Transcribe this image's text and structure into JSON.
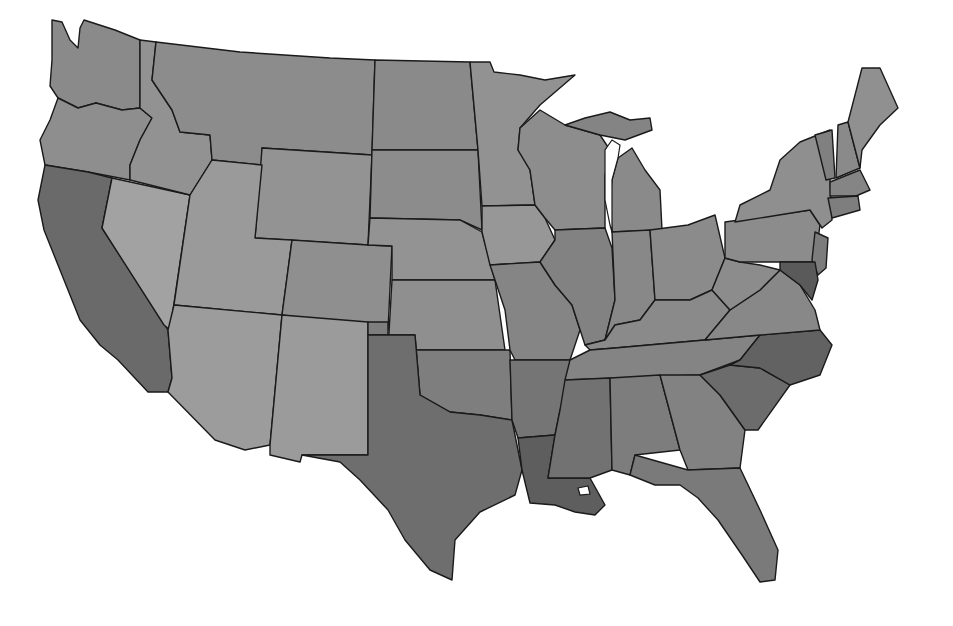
{
  "map": {
    "type": "choropleth",
    "region": "Contiguous United States",
    "granularity": "county",
    "color_scheme": "grayscale",
    "background": "#ffffff",
    "border_color": "#1a1a1a",
    "legend": null,
    "title": null,
    "states": [
      {
        "id": "WA",
        "fill": "#8a8a8a",
        "points": "52,20 62,22 70,40 78,48 80,28 84,20 115,30 140,40 140,108 122,110 96,103 78,108 58,98 50,86 52,60"
      },
      {
        "id": "OR",
        "fill": "#8e8e8e",
        "points": "58,98 78,108 96,103 122,110 140,108 152,118 140,140 130,165 130,180 88,172 45,165 40,140 50,120"
      },
      {
        "id": "CA",
        "fill": "#6a6a6a",
        "points": "45,165 88,172 112,178 102,228 168,330 172,378 168,392 148,392 118,360 100,345 80,320 60,270 44,230 38,200"
      },
      {
        "id": "NV",
        "fill": "#a2a2a2",
        "points": "112,178 190,195 170,330 164,325 102,228"
      },
      {
        "id": "ID",
        "fill": "#929292",
        "points": "140,40 156,42 152,80 172,110 180,132 210,135 212,160 190,195 130,180 130,165 140,140 152,118 140,108"
      },
      {
        "id": "MT",
        "fill": "#8c8c8c",
        "points": "156,42 240,52 330,58 375,60 372,155 262,148 262,165 212,160 210,135 180,132 172,110 152,80"
      },
      {
        "id": "WY",
        "fill": "#939393",
        "points": "262,148 372,155 368,245 255,238"
      },
      {
        "id": "UT",
        "fill": "#9a9a9a",
        "points": "190,195 212,160 262,165 255,238 292,240 282,315 174,305"
      },
      {
        "id": "AZ",
        "fill": "#9c9c9c",
        "points": "174,305 282,315 270,445 245,450 215,440 168,392 172,378 168,330"
      },
      {
        "id": "CO",
        "fill": "#8f8f8f",
        "points": "292,240 368,245 392,246 388,330 282,315"
      },
      {
        "id": "NM",
        "fill": "#9b9b9b",
        "points": "282,315 368,322 368,455 302,455 300,462 270,455 270,445"
      },
      {
        "id": "ND",
        "fill": "#8a8a8a",
        "points": "375,60 470,62 478,150 372,150"
      },
      {
        "id": "SD",
        "fill": "#8c8c8c",
        "points": "372,150 478,150 482,230 460,220 370,218"
      },
      {
        "id": "NE",
        "fill": "#939393",
        "points": "370,218 460,220 482,232 495,280 392,280 392,246 368,245"
      },
      {
        "id": "KS",
        "fill": "#8f8f8f",
        "points": "392,280 495,280 505,350 388,350"
      },
      {
        "id": "OK",
        "fill": "#7e7e7e",
        "points": "368,322 388,322 388,350 510,350 512,420 480,415 450,412 420,395 415,335 368,335"
      },
      {
        "id": "TX",
        "fill": "#6e6e6e",
        "points": "368,335 415,335 420,395 450,412 480,415 512,420 522,470 515,495 480,512 455,540 452,580 430,570 405,540 388,510 360,480 340,462 302,455 368,455"
      },
      {
        "id": "MN",
        "fill": "#929292",
        "points": "470,62 490,62 494,72 520,75 545,80 575,75 540,105 520,128 518,150 530,170 535,205 482,206 478,150"
      },
      {
        "id": "IA",
        "fill": "#979797",
        "points": "482,206 535,205 545,218 555,240 540,262 490,265 482,232"
      },
      {
        "id": "MO",
        "fill": "#858585",
        "points": "490,265 540,262 555,285 572,305 580,330 570,360 515,360 510,350 505,310 495,280"
      },
      {
        "id": "AR",
        "fill": "#757575",
        "points": "510,360 570,360 572,385 560,410 555,435 518,438 512,420"
      },
      {
        "id": "LA",
        "fill": "#5e5e5e",
        "points": "518,438 555,435 548,478 590,478 605,505 595,515 575,512 555,505 530,503 522,470"
      },
      {
        "id": "WI",
        "fill": "#8d8d8d",
        "points": "520,128 540,110 565,125 600,135 610,150 605,175 605,228 555,230 545,218 535,205 530,170 518,150"
      },
      {
        "id": "IL",
        "fill": "#828282",
        "points": "555,230 605,228 612,248 615,300 605,340 585,345 572,305 555,285 540,262 555,240"
      },
      {
        "id": "MI",
        "fill": "#8a8a8a",
        "points": "618,158 632,148 645,170 660,190 662,230 612,232 610,200 612,180"
      },
      {
        "id": "MI-UP",
        "fill": "#848484",
        "points": "565,125 585,118 610,112 630,120 650,118 652,130 625,140 600,135"
      },
      {
        "id": "IN",
        "fill": "#888888",
        "points": "612,232 650,230 655,300 640,320 615,325 605,340 615,300"
      },
      {
        "id": "OH",
        "fill": "#8b8b8b",
        "points": "650,230 688,225 715,215 725,258 712,290 690,300 660,300 655,300"
      },
      {
        "id": "KY",
        "fill": "#8a8a8a",
        "points": "585,345 605,340 615,325 640,320 655,300 690,300 712,290 730,310 705,340 615,348 590,350"
      },
      {
        "id": "TN",
        "fill": "#848484",
        "points": "570,360 590,350 615,348 705,340 760,335 740,360 700,375 565,380"
      },
      {
        "id": "MS",
        "fill": "#727272",
        "points": "565,380 610,378 612,470 590,478 548,478 555,435 560,410"
      },
      {
        "id": "AL",
        "fill": "#7d7d7d",
        "points": "610,378 660,375 680,450 635,455 630,475 612,470"
      },
      {
        "id": "GA",
        "fill": "#828282",
        "points": "660,375 700,375 720,395 745,430 740,468 688,470 680,450"
      },
      {
        "id": "FL",
        "fill": "#7a7a7a",
        "points": "630,475 635,455 688,470 740,468 760,510 778,550 775,580 760,582 742,555 718,520 698,498 680,485 655,485"
      },
      {
        "id": "SC",
        "fill": "#6c6c6c",
        "points": "700,375 730,365 760,368 790,385 758,430 745,430 720,395"
      },
      {
        "id": "NC",
        "fill": "#626262",
        "points": "740,360 760,335 820,330 832,345 820,375 790,385 760,368 730,365"
      },
      {
        "id": "VA",
        "fill": "#888888",
        "points": "705,340 730,310 760,290 780,270 800,285 815,310 820,330 760,335"
      },
      {
        "id": "WV",
        "fill": "#8c8c8c",
        "points": "712,290 725,258 740,262 760,265 780,270 760,290 730,310"
      },
      {
        "id": "PA",
        "fill": "#8c8c8c",
        "points": "725,222 810,210 820,225 815,262 740,262 725,258"
      },
      {
        "id": "NY",
        "fill": "#8f8f8f",
        "points": "740,205 770,190 780,160 800,142 830,130 830,180 832,220 822,228 810,210 735,222"
      },
      {
        "id": "VT",
        "fill": "#808080",
        "points": "815,135 832,130 835,178 826,180"
      },
      {
        "id": "NH",
        "fill": "#8a8a8a",
        "points": "838,125 848,122 860,168 836,178"
      },
      {
        "id": "ME",
        "fill": "#909090",
        "points": "848,122 862,68 880,68 898,108 880,125 862,150 860,168"
      },
      {
        "id": "MA",
        "fill": "#858585",
        "points": "830,182 860,170 870,190 856,196 830,196"
      },
      {
        "id": "CT-RI",
        "fill": "#7e7e7e",
        "points": "828,198 858,196 860,210 832,218"
      },
      {
        "id": "NJ",
        "fill": "#7c7c7c",
        "points": "815,232 828,238 826,268 818,275 812,260"
      },
      {
        "id": "MD-DE",
        "fill": "#5a5a5a",
        "points": "780,262 815,262 818,280 812,300 800,285 780,270"
      }
    ],
    "lakes": [
      {
        "id": "lake-michigan",
        "points": "612,180 618,158 620,145 612,140 605,150 605,200 610,225 612,232"
      },
      {
        "id": "lake-pontchartrain",
        "points": "578,488 588,486 590,494 580,495"
      }
    ]
  }
}
